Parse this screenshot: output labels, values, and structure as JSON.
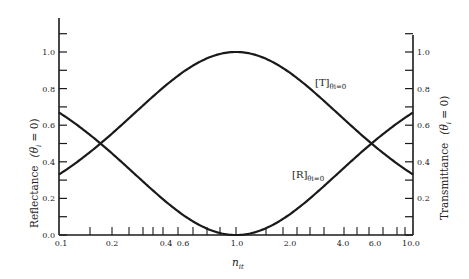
{
  "chart_data": {
    "type": "line",
    "title": "",
    "xlabel": "n_it",
    "ylabel_left": "Reflectance (θi = 0)",
    "ylabel_right": "Transmittance (θi = 0)",
    "x_scale": "log",
    "xlim": [
      0.1,
      10.0
    ],
    "ylim_left": [
      0.0,
      1.0
    ],
    "ylim_right": [
      0.0,
      1.0
    ],
    "x_tick_labels": [
      "0.1",
      "0.2",
      "0.4",
      "0.6",
      "1.0",
      "2.0",
      "4.0",
      "6.0",
      "10.0"
    ],
    "y_tick_labels_left": [
      "0.0",
      "0.2",
      "0.4",
      "0.6",
      "0.8",
      "1.0"
    ],
    "y_tick_labels_right": [
      "0.2",
      "0.4",
      "0.6",
      "0.8",
      "1.0"
    ],
    "grid": false,
    "legend": "inline curve labels",
    "x": [
      0.1,
      0.15,
      0.2,
      0.3,
      0.4,
      0.6,
      0.8,
      1.0,
      1.25,
      1.67,
      2.5,
      3.33,
      5.0,
      6.67,
      10.0
    ],
    "series": [
      {
        "name": "[R]θi=0",
        "values": [
          0.669,
          0.546,
          0.444,
          0.29,
          0.184,
          0.063,
          0.012,
          0.0,
          0.012,
          0.063,
          0.184,
          0.29,
          0.444,
          0.546,
          0.669
        ]
      },
      {
        "name": "[T]θi=0",
        "values": [
          0.331,
          0.454,
          0.556,
          0.71,
          0.816,
          0.938,
          0.988,
          1.0,
          0.988,
          0.938,
          0.816,
          0.71,
          0.556,
          0.454,
          0.331
        ]
      }
    ],
    "annotations": [
      "[T]θi=0",
      "[R]θi=0"
    ]
  },
  "labels": {
    "x_title": "n",
    "x_title_sub": "it",
    "left_title": "Reflectance",
    "left_title_paren": "(θ",
    "left_title_sub": "i",
    "left_title_end": " = 0)",
    "right_title": "Transmittance",
    "right_title_paren": "(θ",
    "right_title_sub": "i",
    "right_title_end": " = 0)",
    "T_label": "[T]",
    "T_sub": "θi=0",
    "R_label": "[R]",
    "R_sub": "θi=0"
  }
}
